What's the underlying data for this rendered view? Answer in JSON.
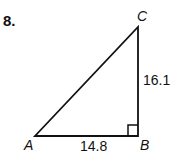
{
  "problem": {
    "number": "8."
  },
  "triangle": {
    "vertices": {
      "A": "A",
      "B": "B",
      "C": "C"
    },
    "sides": {
      "AB": "14.8",
      "BC": "16.1"
    },
    "right_angle_at": "B"
  }
}
